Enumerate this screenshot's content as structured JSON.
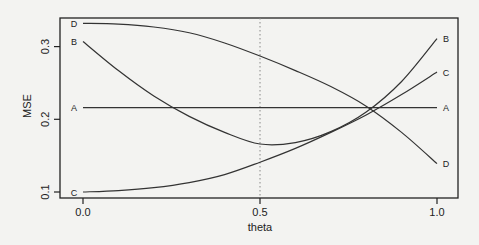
{
  "chart_data": {
    "type": "line",
    "title": "",
    "xlabel": "theta",
    "ylabel": "MSE",
    "xlim": [
      0.0,
      1.0
    ],
    "ylim": [
      0.1,
      0.33
    ],
    "x_ticks": [
      "0.0",
      "0.5",
      "1.0"
    ],
    "y_ticks": [
      "0.1",
      "0.2",
      "0.3"
    ],
    "grid": false,
    "legend": "none (curves labeled at both ends)",
    "reference_line": {
      "x": 0.5,
      "style": "dotted vertical"
    },
    "x": [
      0.0,
      0.1,
      0.2,
      0.3,
      0.4,
      0.5,
      0.6,
      0.7,
      0.8,
      0.9,
      1.0
    ],
    "series": [
      {
        "name": "A",
        "values": [
          0.216,
          0.216,
          0.216,
          0.216,
          0.216,
          0.216,
          0.216,
          0.216,
          0.216,
          0.216,
          0.216
        ]
      },
      {
        "name": "B",
        "values": [
          0.307,
          0.267,
          0.232,
          0.204,
          0.182,
          0.166,
          0.168,
          0.183,
          0.21,
          0.252,
          0.311
        ]
      },
      {
        "name": "C",
        "values": [
          0.1,
          0.102,
          0.106,
          0.113,
          0.124,
          0.141,
          0.16,
          0.182,
          0.206,
          0.234,
          0.265
        ]
      },
      {
        "name": "D",
        "values": [
          0.332,
          0.331,
          0.327,
          0.319,
          0.305,
          0.287,
          0.267,
          0.245,
          0.218,
          0.182,
          0.139
        ]
      }
    ]
  }
}
